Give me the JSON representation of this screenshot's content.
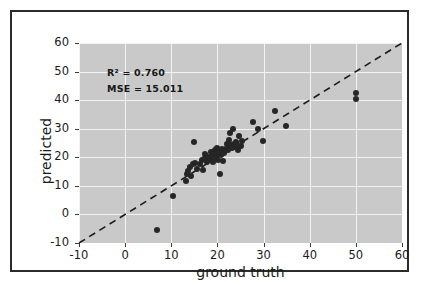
{
  "figure": {
    "background_color": "#ffffff",
    "frame_color": "#2b2b2b",
    "plot_background_color": "#c9c9c9",
    "grid_color": "#f3f3f3",
    "point_color": "#262626",
    "line_color": "#1a1a1a"
  },
  "annotations": {
    "r2": "R² = 0.760",
    "mse": "MSE = 15.011"
  },
  "axis": {
    "x_title": "ground truth",
    "y_title": "predicted",
    "x_ticks": [
      "-10",
      "0",
      "10",
      "20",
      "30",
      "40",
      "50",
      "60"
    ],
    "y_ticks": [
      "60",
      "50",
      "40",
      "30",
      "20",
      "10",
      "0",
      "-10"
    ]
  },
  "chart_data": {
    "type": "scatter",
    "title": "",
    "xlabel": "ground truth",
    "ylabel": "predicted",
    "xlim": [
      -10,
      60
    ],
    "ylim": [
      -10,
      60
    ],
    "xticks": [
      -10,
      0,
      10,
      20,
      30,
      40,
      50,
      60
    ],
    "yticks": [
      -10,
      0,
      10,
      20,
      30,
      40,
      50,
      60
    ],
    "grid": true,
    "legend": false,
    "annotations": [
      "R² = 0.760",
      "MSE = 15.011"
    ],
    "reference_line": {
      "type": "identity",
      "style": "dashed",
      "color": "#1a1a1a",
      "from": [
        -10,
        -10
      ],
      "to": [
        60,
        60
      ]
    },
    "series": [
      {
        "name": "predictions",
        "marker": "o",
        "color": "#262626",
        "points": [
          [
            7.0,
            -5.5
          ],
          [
            10.3,
            6.5
          ],
          [
            13.1,
            11.6
          ],
          [
            13.4,
            14.2
          ],
          [
            13.6,
            15.3
          ],
          [
            14.0,
            16.6
          ],
          [
            14.2,
            13.4
          ],
          [
            14.8,
            17.6
          ],
          [
            15.0,
            25.4
          ],
          [
            15.2,
            18.0
          ],
          [
            15.6,
            16.0
          ],
          [
            16.2,
            17.6
          ],
          [
            16.6,
            19.0
          ],
          [
            16.9,
            15.6
          ],
          [
            17.2,
            19.6
          ],
          [
            17.4,
            21.2
          ],
          [
            17.8,
            18.4
          ],
          [
            18.1,
            20.2
          ],
          [
            18.4,
            19.3
          ],
          [
            18.6,
            22.0
          ],
          [
            18.8,
            20.6
          ],
          [
            19.0,
            18.2
          ],
          [
            19.2,
            21.0
          ],
          [
            19.4,
            22.6
          ],
          [
            19.6,
            20.0
          ],
          [
            19.8,
            23.4
          ],
          [
            20.0,
            21.4
          ],
          [
            20.2,
            19.0
          ],
          [
            20.4,
            22.2
          ],
          [
            20.6,
            14.0
          ],
          [
            20.8,
            20.8
          ],
          [
            21.0,
            22.8
          ],
          [
            21.2,
            18.6
          ],
          [
            21.4,
            21.6
          ],
          [
            21.8,
            23.0
          ],
          [
            22.0,
            24.6
          ],
          [
            22.2,
            22.4
          ],
          [
            22.4,
            26.0
          ],
          [
            22.6,
            23.8
          ],
          [
            22.8,
            28.6
          ],
          [
            23.0,
            24.2
          ],
          [
            23.2,
            23.2
          ],
          [
            23.4,
            29.8
          ],
          [
            23.6,
            24.8
          ],
          [
            23.8,
            23.6
          ],
          [
            24.0,
            25.2
          ],
          [
            24.2,
            24.4
          ],
          [
            24.4,
            22.6
          ],
          [
            24.6,
            27.4
          ],
          [
            25.0,
            24.0
          ],
          [
            25.4,
            25.6
          ],
          [
            27.8,
            32.4
          ],
          [
            28.8,
            30.0
          ],
          [
            29.8,
            25.8
          ],
          [
            32.4,
            36.2
          ],
          [
            34.8,
            30.8
          ],
          [
            50.0,
            42.6
          ],
          [
            50.0,
            40.4
          ]
        ]
      }
    ]
  }
}
